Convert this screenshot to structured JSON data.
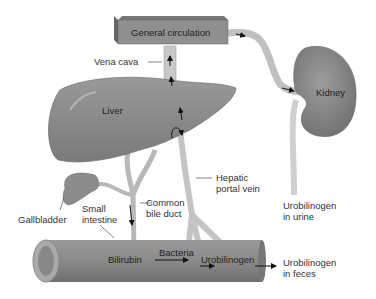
{
  "labels": {
    "general_circulation": "General circulation",
    "vena_cava": "Vena cava",
    "liver": "Liver",
    "kidney": "Kidney",
    "hepatic_portal_vein_1": "Hepatic",
    "hepatic_portal_vein_2": "portal vein",
    "common_bile_duct_1": "Common",
    "common_bile_duct_2": "bile duct",
    "small_intestine_1": "Small",
    "small_intestine_2": "intestine",
    "gallbladder": "Gallbladder",
    "urobilinogen_urine_1": "Urobilinogen",
    "urobilinogen_urine_2": "in urine",
    "bilirubin": "Bilirubin",
    "bacteria": "Bacteria",
    "urobilinogen": "Urobilinogen",
    "urobilinogen_feces_1": "Urobilinogen",
    "urobilinogen_feces_2": "in feces"
  },
  "colors": {
    "organ": "#8a8a8a",
    "vessel": "#c8c8c8",
    "text": "#333333"
  }
}
